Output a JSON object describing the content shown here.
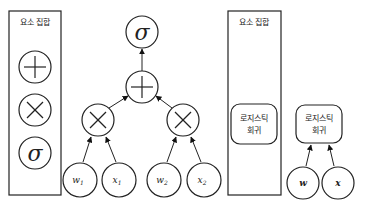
{
  "left_panel": {
    "title": "요소 집합",
    "elements": [
      {
        "name": "plus",
        "symbol": "+"
      },
      {
        "name": "times",
        "symbol": "×"
      },
      {
        "name": "sigma",
        "symbol": "σ"
      }
    ]
  },
  "graph": {
    "output": {
      "symbol": "σ"
    },
    "sum": {
      "symbol": "+"
    },
    "products": [
      {
        "symbol": "×"
      },
      {
        "symbol": "×"
      }
    ],
    "inputs": [
      {
        "base": "w",
        "sub": "1"
      },
      {
        "base": "x",
        "sub": "1"
      },
      {
        "base": "w",
        "sub": "2"
      },
      {
        "base": "x",
        "sub": "2"
      }
    ]
  },
  "right_panel": {
    "title": "요소 집합",
    "element": {
      "line1": "로지스틱",
      "line2": "회귀"
    }
  },
  "compact_graph": {
    "node": {
      "line1": "로지스틱",
      "line2": "회귀"
    },
    "inputs": [
      {
        "label": "w"
      },
      {
        "label": "x"
      }
    ]
  }
}
